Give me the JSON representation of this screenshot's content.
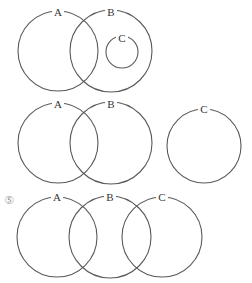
{
  "diagrams": [
    {
      "id": "diagram-1",
      "description": "C is a subset of B; A and B overlap",
      "circles": [
        {
          "label": "A",
          "cx": 58,
          "cy": 51,
          "r": 40
        },
        {
          "label": "B",
          "cx": 111,
          "cy": 51,
          "r": 41
        },
        {
          "label": "C",
          "cx": 122,
          "cy": 52,
          "r": 16
        }
      ]
    },
    {
      "id": "diagram-2",
      "description": "A and B overlap; C disjoint",
      "circles": [
        {
          "label": "A",
          "cx": 58,
          "cy": 143,
          "r": 40
        },
        {
          "label": "B",
          "cx": 111,
          "cy": 143,
          "r": 41
        },
        {
          "label": "C",
          "cx": 204,
          "cy": 146,
          "r": 37
        }
      ]
    },
    {
      "id": "diagram-3",
      "option_number": "⑤",
      "description": "A overlaps B, B overlaps C, A and C disjoint",
      "circles": [
        {
          "label": "A",
          "cx": 57,
          "cy": 237,
          "r": 40
        },
        {
          "label": "B",
          "cx": 110,
          "cy": 237,
          "r": 41
        },
        {
          "label": "C",
          "cx": 162,
          "cy": 237,
          "r": 40
        }
      ]
    }
  ],
  "labels": {
    "d1": {
      "a": "A",
      "b": "B",
      "c": "C"
    },
    "d2": {
      "a": "A",
      "b": "B",
      "c": "C"
    },
    "d3": {
      "a": "A",
      "b": "B",
      "c": "C"
    }
  },
  "option_marker": "⑤",
  "colors": {
    "stroke": "#5a5a5a",
    "text": "#333333",
    "marker": "#9a9a9a"
  }
}
